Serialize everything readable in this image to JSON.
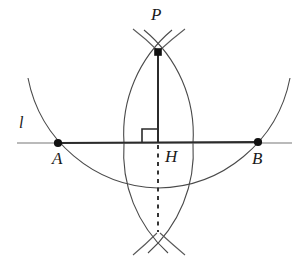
{
  "figure": {
    "background_color": "#ffffff",
    "stroke_color": "#3a3a3a",
    "line_color": "#555555",
    "heavy_color": "#2b2b2b",
    "point_color": "#111111",
    "width": 308,
    "height": 267
  },
  "labels": {
    "point_p": "P",
    "point_a": "A",
    "point_b": "B",
    "foot_h": "H",
    "line_l": "l"
  },
  "points": {
    "P": {
      "label": "P",
      "x": 158,
      "y": 52
    },
    "A": {
      "label": "A",
      "x": 58,
      "y": 143
    },
    "B": {
      "label": "B",
      "x": 258,
      "y": 142
    },
    "H": {
      "label": "H",
      "x": 158,
      "y": 143
    },
    "Q": {
      "label": "",
      "x": 158,
      "y": 232
    }
  },
  "elements": {
    "line_l_label": "l",
    "line_l_x1": 17,
    "line_l_x2": 292,
    "line_l_y": 143,
    "segment_ab_heavy": true,
    "perpendicular_solid": "P to H",
    "perpendicular_dashed": "H to Q",
    "right_angle_marker": "at H, opening up-left",
    "arc_big_center": "P",
    "arc_big_radius": 141,
    "arc_left_center": "A",
    "arc_right_center": "B",
    "arc_lens_radius": 120
  }
}
